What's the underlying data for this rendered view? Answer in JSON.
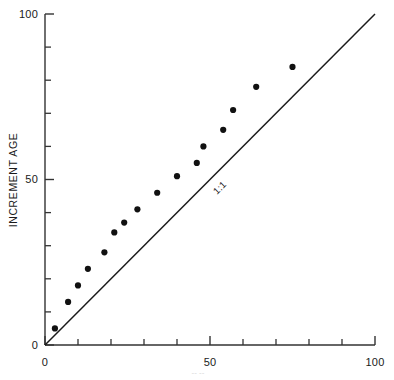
{
  "figure": {
    "background_color": "#ffffff",
    "ink_color": "#1a1a1a"
  },
  "axes": {
    "y_title": "INCREMENT AGE",
    "x_title": "",
    "x_tick_labels": [
      "0",
      "50",
      "100"
    ],
    "y_tick_labels": [
      "0",
      "50",
      "100"
    ]
  },
  "annotations": {
    "reference_line_label": "1:1"
  },
  "footer": {
    "cropped_text": "-- --"
  },
  "chart_data": {
    "type": "scatter",
    "title": "",
    "xlabel": "",
    "ylabel": "INCREMENT AGE",
    "xlim": [
      0,
      100
    ],
    "ylim": [
      0,
      100
    ],
    "xticks": [
      0,
      50,
      100
    ],
    "yticks": [
      0,
      50,
      100
    ],
    "minor_tick_interval": 10,
    "grid": false,
    "legend": null,
    "series": [
      {
        "name": "increment age observations",
        "marker": "filled-circle",
        "color": "#111111",
        "points": [
          [
            3,
            5
          ],
          [
            7,
            13
          ],
          [
            10,
            18
          ],
          [
            13,
            23
          ],
          [
            18,
            28
          ],
          [
            21,
            34
          ],
          [
            24,
            37
          ],
          [
            28,
            41
          ],
          [
            34,
            46
          ],
          [
            40,
            51
          ],
          [
            46,
            55
          ],
          [
            48,
            60
          ],
          [
            54,
            65
          ],
          [
            57,
            71
          ],
          [
            64,
            78
          ],
          [
            75,
            84
          ]
        ]
      }
    ],
    "reference_line": {
      "label": "1:1",
      "from": [
        0,
        0
      ],
      "to": [
        100,
        100
      ],
      "color": "#1a1a1a"
    }
  }
}
